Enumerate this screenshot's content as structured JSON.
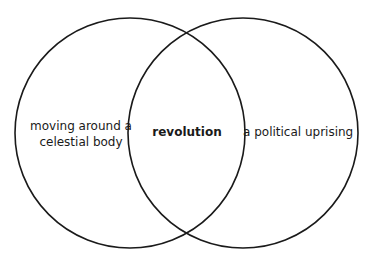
{
  "diagram": {
    "type": "venn",
    "stroke_color": "#1a1a1a",
    "background_color": "#ffffff",
    "circles": [
      {
        "name": "left-set",
        "cx": 130,
        "cy": 133,
        "r": 115
      },
      {
        "name": "right-set",
        "cx": 243,
        "cy": 133,
        "r": 115
      }
    ],
    "labels": {
      "left": "moving around a celestial body",
      "center": "revolution",
      "right": "a political uprising"
    }
  }
}
